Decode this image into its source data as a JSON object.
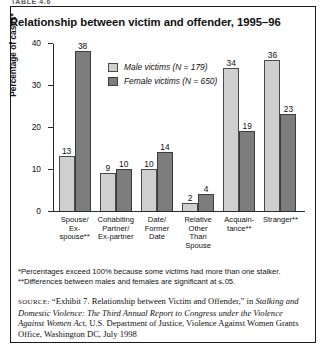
{
  "running_head": "TABLE 4.6",
  "title": "Relationship between victim and offender, 1995–96",
  "legend": {
    "male": "Male victims (N = 179)",
    "female": "Female victims (N = 650)"
  },
  "colors": {
    "male_bar": "#cfcfcf",
    "female_bar": "#7d7d7d",
    "frame": "#1a1a1a",
    "axis": "#2b2b2b"
  },
  "notes": {
    "note1": "*Percentages exceed 100% because some victims had more than one stalker.",
    "note2": "**Differences between males and females are significant at ≤.05."
  },
  "source": {
    "label": "SOURCE:",
    "part1": " “Exhibit 7. Relationship between Victim and Offender,” in ",
    "italic1": "Stalking and Domestic Violence: The Third Annual Report to Congress under the Violence Against Women Act",
    "part2": ", U.S. Department of Justice, Violence Against Women Grants Office, Washington DC, July 1998"
  },
  "chart_data": {
    "type": "bar",
    "title": "Relationship between victim and offender, 1995–96",
    "xlabel": "",
    "ylabel": "Percentage of cases*",
    "ylim": [
      0,
      40
    ],
    "yticks": [
      0,
      10,
      20,
      30,
      40
    ],
    "ytick_labels": [
      "0",
      "10",
      "20",
      "30",
      "40"
    ],
    "grid": false,
    "legend_position": "top-center",
    "categories": [
      "Spouse/\nEx-spouse**",
      "Cohabiting\nPartner/\nEx-partner",
      "Date/\nFormer\nDate",
      "Relative\nOther\nThan Spouse",
      "Acquain-\ntance**",
      "Stranger**"
    ],
    "category_lines": [
      [
        "Spouse/",
        "Ex-spouse**"
      ],
      [
        "Cohabiting",
        "Partner/",
        "Ex-partner"
      ],
      [
        "Date/",
        "Former",
        "Date"
      ],
      [
        "Relative",
        "Other",
        "Than Spouse"
      ],
      [
        "Acquain-",
        "tance**"
      ],
      [
        "Stranger**"
      ]
    ],
    "series": [
      {
        "name": "Male victims (N = 179)",
        "values": [
          13,
          9,
          10,
          2,
          34,
          36
        ]
      },
      {
        "name": "Female victims (N = 650)",
        "values": [
          38,
          10,
          14,
          4,
          19,
          23
        ]
      }
    ]
  }
}
